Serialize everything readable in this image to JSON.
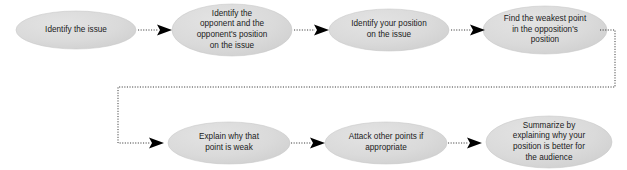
{
  "diagram": {
    "background_color": "#ffffff",
    "node_fill_color": "#d6d6d6",
    "node_fill_color_light": "#e2e2e2",
    "node_text_color": "#1b1b1b",
    "connector_color": "#3a3a3a",
    "connector_style": "dotted",
    "arrowhead_color": "#000000",
    "nodes": [
      {
        "id": "identify-the-issue",
        "label": "Identify the issue",
        "cx": 76,
        "cy": 30,
        "rx": 60,
        "ry": 19
      },
      {
        "id": "identify-opponent-position",
        "label": "Identify the\nopponent and the\nopponent's position\non the issue",
        "cx": 232,
        "cy": 30,
        "rx": 60,
        "ry": 26
      },
      {
        "id": "identify-your-position",
        "label": "Identify your position\non the issue",
        "cx": 389,
        "cy": 30,
        "rx": 60,
        "ry": 21
      },
      {
        "id": "find-weakest-point",
        "label": "Find the weakest point\nin the opposition's\nposition",
        "cx": 545,
        "cy": 30,
        "rx": 62,
        "ry": 24
      },
      {
        "id": "explain-why-point-is-weak",
        "label": "Explain why that\npoint is weak",
        "cx": 229,
        "cy": 143,
        "rx": 61,
        "ry": 21
      },
      {
        "id": "attack-other-points",
        "label": "Attack other points if\nappropriate",
        "cx": 386,
        "cy": 143,
        "rx": 61,
        "ry": 21
      },
      {
        "id": "summarize-position",
        "label": "Summarize by\nexplaining why your\nposition is better for\nthe audience",
        "cx": 549,
        "cy": 142,
        "rx": 63,
        "ry": 26
      }
    ],
    "connectors": [
      {
        "id": "issue-to-opponent",
        "from": "identify-the-issue",
        "to": "identify-opponent-position"
      },
      {
        "id": "opponent-to-your-position",
        "from": "identify-opponent-position",
        "to": "identify-your-position"
      },
      {
        "id": "your-position-to-weakest",
        "from": "identify-your-position",
        "to": "find-weakest-point"
      },
      {
        "id": "weakest-to-explain-wrap",
        "from": "find-weakest-point",
        "to": "explain-why-point-is-weak"
      },
      {
        "id": "explain-to-attack",
        "from": "explain-why-point-is-weak",
        "to": "attack-other-points"
      },
      {
        "id": "attack-to-summarize",
        "from": "attack-other-points",
        "to": "summarize-position"
      }
    ]
  }
}
